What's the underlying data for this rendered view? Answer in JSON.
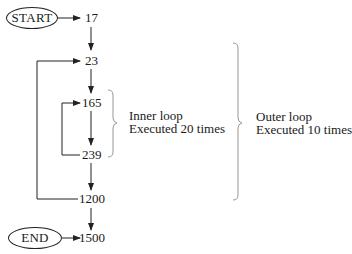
{
  "diagram": {
    "start_label": "START",
    "end_label": "END",
    "nodes": [
      "17",
      "23",
      "165",
      "239",
      "1200",
      "1500"
    ],
    "inner_loop": {
      "title": "Inner loop",
      "detail": "Executed 20 times"
    },
    "outer_loop": {
      "title": "Outer loop",
      "detail": "Executed 10 times"
    },
    "colors": {
      "line": "#222222",
      "brace": "#999999",
      "text": "#1a1a1a"
    }
  }
}
